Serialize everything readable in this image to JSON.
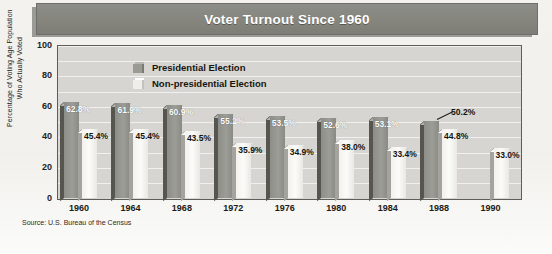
{
  "title": "Voter Turnout Since 1960",
  "source": "Source: U.S. Bureau of the Census",
  "legend": {
    "presidential": "Presidential Election",
    "nonpresidential": "Non-presidential Election"
  },
  "colors": {
    "title_bar": "#86867f",
    "title_text": "#ffffff",
    "plot_background": "#d6d5d1",
    "gridline": "#f2f1ef",
    "presidential_bar": "#9d9d98",
    "presidential_bar_side": "#56564f",
    "nonpresidential_bar": "#fbfbf9",
    "nonpresidential_bar_side": "#a4a39e",
    "axis_text": "#1b1b17"
  },
  "chart_data": {
    "type": "bar",
    "title": "Voter Turnout Since 1960",
    "xlabel": "",
    "ylabel": "Percentage of Voting Age Population Who Actually Voted",
    "ylim": [
      0,
      100
    ],
    "yticks": [
      0,
      20,
      40,
      60,
      80,
      100
    ],
    "grid": true,
    "legend_position": "inside-top-left",
    "categories": [
      "1960",
      "1964",
      "1968",
      "1972",
      "1976",
      "1980",
      "1984",
      "1988",
      "1990"
    ],
    "series": [
      {
        "name": "Presidential Election",
        "values": [
          62.8,
          61.9,
          60.9,
          55.2,
          53.5,
          52.6,
          53.1,
          50.2,
          null
        ],
        "labels": [
          "62.8%",
          "61.9%",
          "60.9%",
          "55.2%",
          "53.5%",
          "52.6%",
          "53.1%",
          "50.2%",
          ""
        ]
      },
      {
        "name": "Non-presidential Election",
        "values": [
          45.4,
          45.4,
          43.5,
          35.9,
          34.9,
          38.0,
          33.4,
          44.8,
          33.0
        ],
        "labels": [
          "45.4%",
          "45.4%",
          "43.5%",
          "35.9%",
          "34.9%",
          "38.0%",
          "33.4%",
          "44.8%",
          "33.0%"
        ]
      }
    ],
    "annotations": [
      {
        "text": "50.2%",
        "note": "leader line pointing to 1988 presidential bar top"
      }
    ]
  },
  "yaxis_title_lines": {
    "line1": "Percentage of Voting Age Population",
    "line2": "Who Actually Voted"
  }
}
